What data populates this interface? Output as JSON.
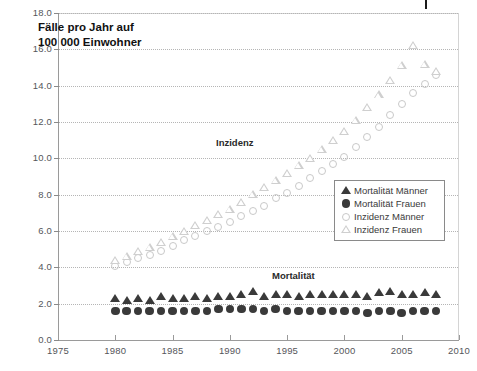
{
  "chart_data": {
    "type": "scatter",
    "title": "Fälle pro Jahr auf\n100 000 Einwohner",
    "xlabel": "",
    "ylabel": "",
    "xlim": [
      1975,
      2010
    ],
    "ylim": [
      0.0,
      18.0
    ],
    "xticks": [
      "1975",
      "1980",
      "1985",
      "1990",
      "1995",
      "2000",
      "2005",
      "2010"
    ],
    "xtick_values": [
      1975,
      1980,
      1985,
      1990,
      1995,
      2000,
      2005,
      2010
    ],
    "yticks": [
      "0.0",
      "2.0",
      "4.0",
      "6.0",
      "8.0",
      "10.0",
      "12.0",
      "14.0",
      "16.0",
      "18.0"
    ],
    "ytick_values": [
      0.0,
      2.0,
      4.0,
      6.0,
      8.0,
      10.0,
      12.0,
      14.0,
      16.0,
      18.0
    ],
    "grid": true,
    "legend_position": "center-right",
    "annotations": [
      {
        "text": "Inzidenz",
        "x": 1992.5,
        "y": 11.2
      },
      {
        "text": "Mortalität",
        "x": 1997.5,
        "y": 3.8
      }
    ],
    "x": [
      1980,
      1981,
      1982,
      1983,
      1984,
      1985,
      1986,
      1987,
      1988,
      1989,
      1990,
      1991,
      1992,
      1993,
      1994,
      1995,
      1996,
      1997,
      1998,
      1999,
      2000,
      2001,
      2002,
      2003,
      2004,
      2005,
      2006,
      2007,
      2008
    ],
    "series": [
      {
        "name": "Mortalität Männer",
        "marker": "triangle-filled",
        "color": "#3a3a3a",
        "values": [
          2.3,
          2.2,
          2.3,
          2.2,
          2.4,
          2.3,
          2.3,
          2.4,
          2.3,
          2.4,
          2.4,
          2.5,
          2.7,
          2.4,
          2.5,
          2.5,
          2.4,
          2.5,
          2.5,
          2.5,
          2.5,
          2.5,
          2.4,
          2.6,
          2.7,
          2.5,
          2.5,
          2.6,
          2.5
        ]
      },
      {
        "name": "Mortalität Frauen",
        "marker": "circle-filled",
        "color": "#3a3a3a",
        "values": [
          1.6,
          1.6,
          1.6,
          1.6,
          1.6,
          1.6,
          1.6,
          1.6,
          1.6,
          1.7,
          1.7,
          1.7,
          1.7,
          1.6,
          1.7,
          1.6,
          1.6,
          1.6,
          1.6,
          1.6,
          1.6,
          1.6,
          1.5,
          1.6,
          1.6,
          1.5,
          1.6,
          1.6,
          1.6
        ]
      },
      {
        "name": "Inzidenz Männer",
        "marker": "circle-open",
        "color": "#c9c9c9",
        "values": [
          4.1,
          4.3,
          4.5,
          4.7,
          4.9,
          5.2,
          5.5,
          5.7,
          6.0,
          6.2,
          6.5,
          6.8,
          7.1,
          7.4,
          7.8,
          8.1,
          8.5,
          8.9,
          9.3,
          9.7,
          10.1,
          10.6,
          11.2,
          11.7,
          12.4,
          13.0,
          13.6,
          14.1,
          14.6
        ]
      },
      {
        "name": "Inzidenz Frauen",
        "marker": "triangle-open",
        "color": "#cfcfcf",
        "values": [
          4.4,
          4.6,
          4.9,
          5.1,
          5.4,
          5.7,
          6.0,
          6.3,
          6.6,
          6.9,
          7.2,
          7.6,
          8.0,
          8.4,
          8.8,
          9.2,
          9.6,
          10.0,
          10.5,
          11.0,
          11.5,
          12.1,
          12.8,
          13.5,
          14.3,
          15.1,
          16.2,
          15.2,
          14.8
        ]
      }
    ]
  },
  "legend": {
    "items": [
      {
        "label": "Mortalität Männer",
        "marker": "triangle-filled"
      },
      {
        "label": "Mortalität Frauen",
        "marker": "circle-filled"
      },
      {
        "label": "Inzidenz Männer",
        "marker": "circle-open"
      },
      {
        "label": "Inzidenz Frauen",
        "marker": "triangle-open"
      }
    ]
  }
}
